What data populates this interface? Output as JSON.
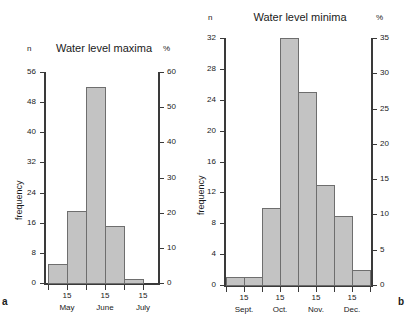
{
  "figure": {
    "panel_a_letter": "a",
    "panel_b_letter": "b",
    "bar_fill": "#c3c3c3",
    "bar_stroke": "#6e6e6e",
    "axis_color": "#3a3a3a"
  },
  "chart_data": [
    {
      "type": "bar",
      "panel": "a",
      "title": "Water level maxima",
      "xlabel": "",
      "ylabel": "frequency",
      "left_axis_unit": "n",
      "right_axis_unit": "%",
      "ylim": [
        0,
        56
      ],
      "yticks": [
        0,
        8,
        16,
        24,
        32,
        40,
        48,
        56
      ],
      "ytick_labels": [
        "0",
        "8",
        "16",
        "24",
        "32",
        "40",
        "48",
        "56"
      ],
      "right_ylim": [
        0,
        60
      ],
      "right_yticks": [
        0,
        10,
        20,
        30,
        40,
        50,
        60
      ],
      "right_ytick_labels": [
        "0",
        "10",
        "20",
        "30",
        "40",
        "50",
        "60"
      ],
      "grid": false,
      "legend": "none",
      "xtick_labels": [
        "15",
        "15",
        "15"
      ],
      "xtick_months": [
        "May",
        "June",
        "July"
      ],
      "categories": [
        "1 May",
        "15 May",
        "1 June",
        "15 June",
        "1 July"
      ],
      "values": [
        5,
        19,
        52,
        15,
        1
      ],
      "percent_values": [
        5.4,
        20.4,
        55.7,
        16.1,
        1.1
      ]
    },
    {
      "type": "bar",
      "panel": "b",
      "title": "Water level minima",
      "xlabel": "",
      "ylabel": "frequency",
      "left_axis_unit": "n",
      "right_axis_unit": "%",
      "ylim": [
        0,
        32
      ],
      "yticks": [
        0,
        4,
        8,
        12,
        16,
        20,
        24,
        28,
        32
      ],
      "ytick_labels": [
        "0",
        "4",
        "8",
        "12",
        "16",
        "20",
        "24",
        "28",
        "32"
      ],
      "right_ylim": [
        0,
        35
      ],
      "right_yticks": [
        0,
        5,
        10,
        15,
        20,
        25,
        30,
        35
      ],
      "right_ytick_labels": [
        "0",
        "5",
        "10",
        "15",
        "20",
        "25",
        "30",
        "35"
      ],
      "grid": false,
      "legend": "none",
      "xtick_labels": [
        "15",
        "15",
        "15",
        "15"
      ],
      "xtick_months": [
        "Sept.",
        "Oct.",
        "Nov.",
        "Dec."
      ],
      "categories": [
        "1 Sept.",
        "15 Sept.",
        "1 Oct.",
        "15 Oct.",
        "1 Nov.",
        "15 Nov.",
        "1 Dec.",
        "15 Dec."
      ],
      "values": [
        1,
        1,
        10,
        32,
        25,
        13,
        9,
        2
      ],
      "percent_values": [
        1.1,
        1.1,
        10.9,
        34.8,
        27.2,
        14.1,
        9.8,
        2.2
      ]
    }
  ]
}
